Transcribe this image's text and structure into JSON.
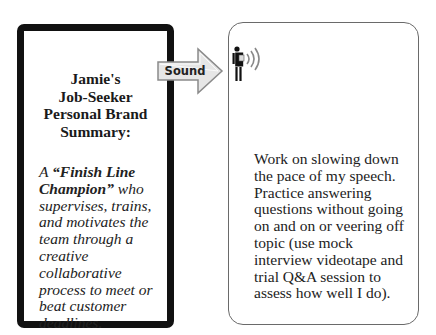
{
  "left_card": {
    "title_lines": [
      "Jamie's",
      "Job-Seeker",
      "Personal Brand",
      "Summary:"
    ],
    "summary_prefix": "A ",
    "summary_emphasis": "“Finish Line Champion”",
    "summary_rest": " who supervises, trains, and motivates the team through a creative collaborative process to meet or beat customer deadlines."
  },
  "arrow": {
    "label": "Sound",
    "fill_color": "#e6e6e6",
    "stroke_color": "#8a8a8a"
  },
  "right_card": {
    "icon": "person-speaking-icon",
    "text": "Work on slowing down the pace of my speech. Practice answering questions without going on and on or veering off topic (use mock interview videotape and trial Q&A session to assess how well I do)."
  }
}
